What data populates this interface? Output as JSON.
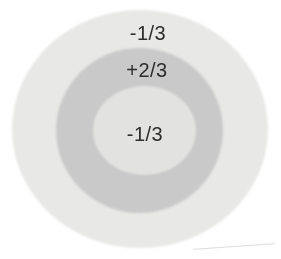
{
  "figure": {
    "outer_shell_label": "-1/3",
    "middle_shell_label": "+2/3",
    "inner_core_label": "-1/3"
  },
  "colors": {
    "background": "#ffffff",
    "outer_shell": "#e8e8e7",
    "middle_shell": "#c9c9c9",
    "inner_core": "#e2e2e1",
    "label_text": "#2d2d2d",
    "crease_line": "#dcdcdc"
  }
}
